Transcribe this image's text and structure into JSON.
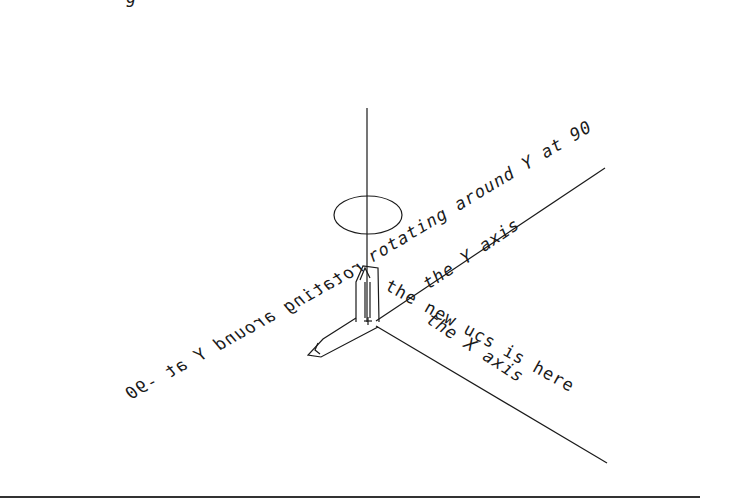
{
  "diagram": {
    "title_fragment": "g",
    "labels": {
      "rotation_note": "rotating around Y at 90",
      "rotation_note_mirrored": "rotating around Y at -90",
      "y_axis_label": "the Y axis",
      "ucs_note": "the new ucs is here",
      "x_axis_label": "the X axis"
    },
    "elements": {
      "z_axis": "vertical axis line",
      "rotation_ellipse": "rotation indicator ellipse",
      "ucs_icon": "UCS icon",
      "bottom_rule": "separator line"
    },
    "colors": {
      "background": "#ffffff",
      "ink": "#1a1a1a"
    }
  }
}
